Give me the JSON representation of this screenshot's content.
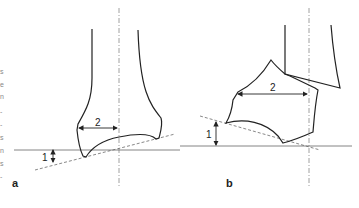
{
  "figure": {
    "panels": [
      {
        "id": "a",
        "label": "a",
        "dimension_labels": {
          "angle": "1",
          "width": "2"
        }
      },
      {
        "id": "b",
        "label": "b",
        "dimension_labels": {
          "angle": "1",
          "width": "2"
        }
      }
    ],
    "edge_text_fragments": [
      "s",
      "e",
      "n",
      "-",
      "-",
      "s",
      "n",
      "s",
      "-"
    ]
  },
  "colors": {
    "line": "#222222",
    "dashed": "#555555",
    "axis": "#888888",
    "background": "#ffffff"
  }
}
